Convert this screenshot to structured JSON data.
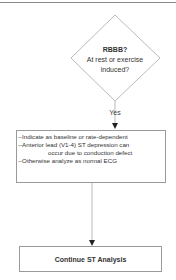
{
  "diagram": {
    "type": "flowchart",
    "decision": {
      "title": "RBBB?",
      "question_line1": "At rest or exercise",
      "question_line2": "induced?"
    },
    "edge_label": "Yes",
    "action_box": {
      "lines": [
        "--Indicate as baseline or rate-dependent",
        "--Anterior lead (V1-4) ST depression can",
        "occur due to conduction defect",
        "--Otherwise analyze as normal ECG"
      ]
    },
    "terminal_box": {
      "label": "Continue ST Analysis"
    },
    "colors": {
      "stroke": "#9a9a9a",
      "text": "#333333",
      "arrow": "#222222",
      "top_rule": "#8a8a8a"
    }
  }
}
